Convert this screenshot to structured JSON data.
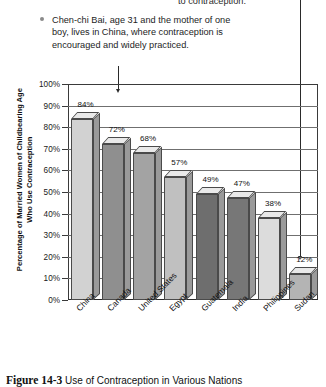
{
  "annotations": {
    "clipped_top_text": "to contraception.",
    "callout_text": "Chen-chi Bai, age 31 and the mother of one boy, lives in China, where contraception is encouraged and widely practiced."
  },
  "caption": {
    "figure_label": "Figure 14-3",
    "text": "Use of Contraception in Various Nations"
  },
  "chart_data": {
    "type": "bar",
    "title": "",
    "xlabel": "",
    "ylabel": "Percentage of Married Women of Childbearing Age Who Use Contraception",
    "ylabel_line1": "Percentage of Married Women of Childbearing Age",
    "ylabel_line2": "Who Use Contraception",
    "categories": [
      "China",
      "Canada",
      "United States",
      "Egypt",
      "Guatemala",
      "India",
      "Philippines",
      "Sudan"
    ],
    "values": [
      84,
      72,
      68,
      57,
      49,
      47,
      38,
      12
    ],
    "value_labels": [
      "84%",
      "72%",
      "68%",
      "57%",
      "49%",
      "47%",
      "38%",
      "12%"
    ],
    "bar_colors": [
      "#d2d2d2",
      "#8f8f8f",
      "#a3a3a3",
      "#c0c0c0",
      "#6e6e6e",
      "#777777",
      "#dcdcdc",
      "#b4b4b4"
    ],
    "ylim": [
      0,
      100
    ],
    "yticks": [
      100,
      90,
      80,
      70,
      60,
      50,
      40,
      30,
      20,
      10,
      0
    ],
    "ytick_labels": [
      "100%",
      "90%",
      "80%",
      "70%",
      "60%",
      "50%",
      "40%",
      "30%",
      "20%",
      "10%",
      "0%"
    ],
    "grid": true,
    "legend": "none"
  }
}
